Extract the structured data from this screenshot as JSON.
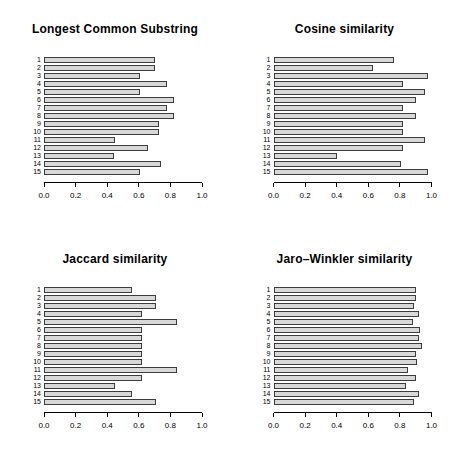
{
  "page": {
    "background": "#ffffff",
    "text_color": "#000000",
    "bar_fill": "#d8d8d8",
    "bar_border": "#3d3d3d"
  },
  "chart_data": [
    {
      "type": "bar",
      "orientation": "horizontal",
      "title": "Longest Common Substring",
      "categories": [
        "1",
        "2",
        "3",
        "4",
        "5",
        "6",
        "7",
        "8",
        "9",
        "10",
        "11",
        "12",
        "13",
        "14",
        "15"
      ],
      "values": [
        0.7,
        0.7,
        0.61,
        0.78,
        0.61,
        0.82,
        0.78,
        0.82,
        0.73,
        0.73,
        0.45,
        0.66,
        0.44,
        0.74,
        0.61
      ],
      "xlim": [
        0,
        1
      ],
      "xticks": [
        0,
        0.2,
        0.4,
        0.6,
        0.8,
        1.0
      ],
      "xtick_labels": [
        "0.0",
        "0.2",
        "0.4",
        "0.6",
        "0.8",
        "1.0"
      ],
      "xlabel": "",
      "ylabel": "",
      "grid": false,
      "legend": false,
      "bar_fill": "#d8d8d8",
      "bar_border": "#3d3d3d"
    },
    {
      "type": "bar",
      "orientation": "horizontal",
      "title": "Cosine similarity",
      "categories": [
        "1",
        "2",
        "3",
        "4",
        "5",
        "6",
        "7",
        "8",
        "9",
        "10",
        "11",
        "12",
        "13",
        "14",
        "15"
      ],
      "values": [
        0.76,
        0.63,
        0.98,
        0.82,
        0.96,
        0.9,
        0.82,
        0.9,
        0.82,
        0.82,
        0.96,
        0.82,
        0.4,
        0.81,
        0.98
      ],
      "xlim": [
        0,
        1
      ],
      "xticks": [
        0,
        0.2,
        0.4,
        0.6,
        0.8,
        1.0
      ],
      "xtick_labels": [
        "0.0",
        "0.2",
        "0.4",
        "0.6",
        "0.8",
        "1.0"
      ],
      "xlabel": "",
      "ylabel": "",
      "grid": false,
      "legend": false,
      "bar_fill": "#d8d8d8",
      "bar_border": "#3d3d3d"
    },
    {
      "type": "bar",
      "orientation": "horizontal",
      "title": "Jaccard similarity",
      "categories": [
        "1",
        "2",
        "3",
        "4",
        "5",
        "6",
        "7",
        "8",
        "9",
        "10",
        "11",
        "12",
        "13",
        "14",
        "15"
      ],
      "values": [
        0.56,
        0.71,
        0.71,
        0.62,
        0.84,
        0.62,
        0.62,
        0.62,
        0.62,
        0.62,
        0.84,
        0.62,
        0.45,
        0.56,
        0.71
      ],
      "xlim": [
        0,
        1
      ],
      "xticks": [
        0,
        0.2,
        0.4,
        0.6,
        0.8,
        1.0
      ],
      "xtick_labels": [
        "0.0",
        "0.2",
        "0.4",
        "0.6",
        "0.8",
        "1.0"
      ],
      "xlabel": "",
      "ylabel": "",
      "grid": false,
      "legend": false,
      "bar_fill": "#d8d8d8",
      "bar_border": "#3d3d3d"
    },
    {
      "type": "bar",
      "orientation": "horizontal",
      "title": "Jaro–Winkler similarity",
      "categories": [
        "1",
        "2",
        "3",
        "4",
        "5",
        "6",
        "7",
        "8",
        "9",
        "10",
        "11",
        "12",
        "13",
        "14",
        "15"
      ],
      "values": [
        0.9,
        0.9,
        0.89,
        0.92,
        0.88,
        0.93,
        0.92,
        0.94,
        0.9,
        0.91,
        0.85,
        0.9,
        0.84,
        0.92,
        0.89
      ],
      "xlim": [
        0,
        1
      ],
      "xticks": [
        0,
        0.2,
        0.4,
        0.6,
        0.8,
        1.0
      ],
      "xtick_labels": [
        "0.0",
        "0.2",
        "0.4",
        "0.6",
        "0.8",
        "1.0"
      ],
      "xlabel": "",
      "ylabel": "",
      "grid": false,
      "legend": false,
      "bar_fill": "#d8d8d8",
      "bar_border": "#3d3d3d"
    }
  ]
}
